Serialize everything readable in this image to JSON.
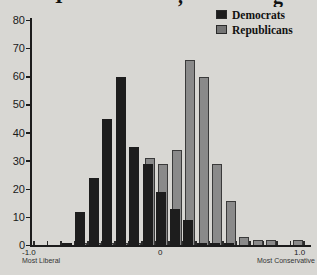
{
  "title": {
    "visibility": "partial",
    "fragments": [
      {
        "glyph": "I",
        "x": 55
      },
      {
        "glyph": ",",
        "x": 178
      },
      {
        "glyph": "g",
        "x": 273
      }
    ]
  },
  "legend": {
    "items": [
      {
        "label": "Democrats",
        "color": "#1d1d1d"
      },
      {
        "label": "Republicans",
        "color": "#757575"
      }
    ]
  },
  "xaxis": {
    "ticks": [
      {
        "label": "-1.0",
        "sublabel": "Most Liberal"
      },
      {
        "label": "0",
        "sublabel": ""
      },
      {
        "label": "1.0",
        "sublabel": "Most Conservative"
      }
    ]
  },
  "chart_data": {
    "type": "bar",
    "subtype": "overlapping-histogram",
    "title": "",
    "xlabel": "",
    "ylabel": "",
    "grid": false,
    "legend_position": "top-right",
    "ylim": [
      0,
      80
    ],
    "yticks": [
      0,
      10,
      20,
      30,
      40,
      50,
      60,
      70,
      80
    ],
    "xlim": [
      -1.0,
      1.0
    ],
    "bin_width": 0.1,
    "bin_centers": [
      -0.95,
      -0.85,
      -0.75,
      -0.65,
      -0.55,
      -0.45,
      -0.35,
      -0.25,
      -0.15,
      -0.05,
      0.05,
      0.15,
      0.25,
      0.35,
      0.45,
      0.55,
      0.65,
      0.75,
      0.85,
      0.95
    ],
    "series": [
      {
        "name": "Democrats",
        "color": "#1d1d1d",
        "values": [
          0,
          0,
          1,
          12,
          24,
          45,
          60,
          35,
          29,
          19,
          13,
          9,
          1,
          1,
          1,
          0,
          0,
          0,
          0,
          0
        ]
      },
      {
        "name": "Republicans",
        "color": "#8a8a8a",
        "values": [
          0,
          0,
          0,
          1,
          1,
          1,
          1,
          1,
          31,
          29,
          34,
          66,
          60,
          29,
          16,
          3,
          2,
          2,
          0,
          2
        ]
      }
    ],
    "x_axis_endpoint_labels": {
      "left": "-1.0 Most Liberal",
      "right": "1.0 Most Conservative"
    }
  }
}
